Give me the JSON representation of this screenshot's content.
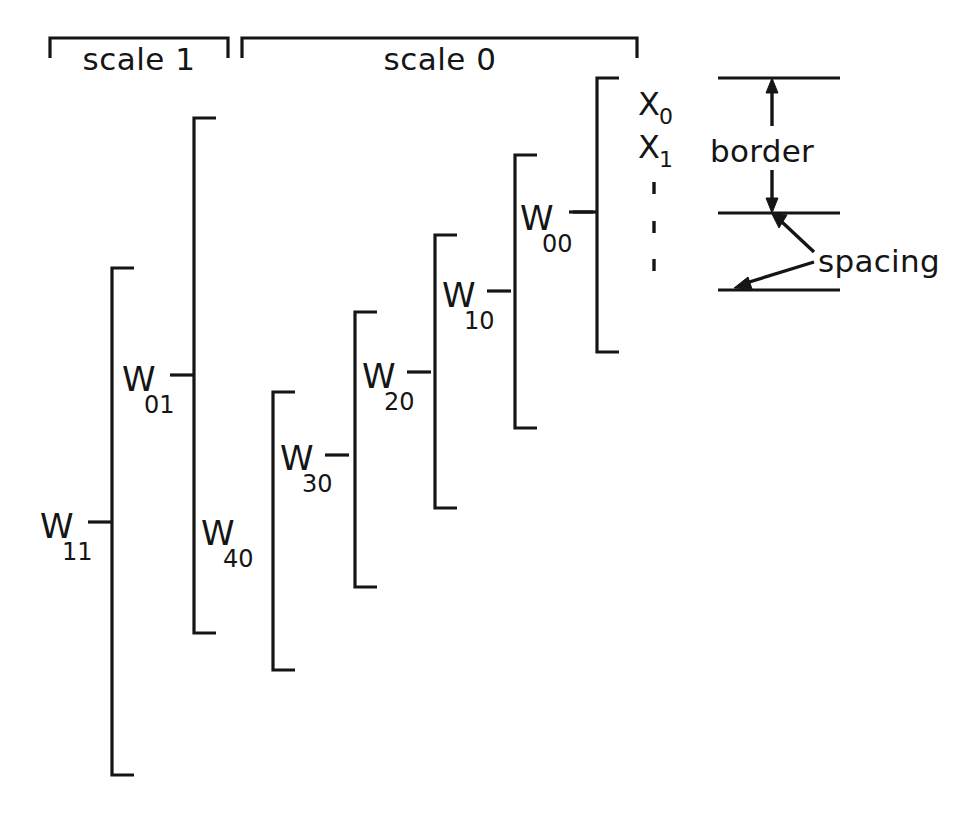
{
  "diagram": {
    "ink_color": "#151515",
    "background_color": "#ffffff",
    "scale_groups": [
      {
        "id": "scale-1",
        "label": "scale 1",
        "x_start": 50,
        "x_end": 228,
        "y": 38,
        "tick_depth": 20,
        "label_x": 139,
        "label_y": 68
      },
      {
        "id": "scale-0",
        "label": "scale 0",
        "x_start": 242,
        "x_end": 637,
        "y": 38,
        "tick_depth": 20,
        "label_x": 440,
        "label_y": 68
      }
    ],
    "brackets": [
      {
        "id": "w11",
        "base": "W",
        "sub": "11",
        "x": 112,
        "y_top": 268,
        "y_bottom": 775,
        "y_tick": 522,
        "arm": 22,
        "label_x": 44,
        "label_y": 545
      },
      {
        "id": "w01-w40",
        "base": "W",
        "sub": "01",
        "sub_second": "40",
        "x": 194,
        "y_top": 118,
        "y_bottom": 633,
        "y_tick": 375,
        "arm": 22,
        "label_x": 126,
        "label_y": 398,
        "label2_x": 205,
        "label2_y": 552
      },
      {
        "id": "w30",
        "base": "W",
        "sub": "30",
        "x": 273,
        "y_top": 392,
        "y_bottom": 670,
        "y_tick": 455,
        "arm": 22,
        "label_x": 284,
        "label_y": 477
      },
      {
        "id": "w20",
        "base": "W",
        "sub": "20",
        "x": 355,
        "y_top": 312,
        "y_bottom": 587,
        "y_tick": 372,
        "arm": 22,
        "label_x": 366,
        "label_y": 395
      },
      {
        "id": "w10",
        "base": "W",
        "sub": "10",
        "x": 435,
        "y_top": 235,
        "y_bottom": 508,
        "y_tick": 291,
        "arm": 22,
        "label_x": 446,
        "label_y": 315
      },
      {
        "id": "w00",
        "base": "W",
        "sub": "00",
        "x": 515,
        "y_top": 155,
        "y_bottom": 428,
        "y_tick": 212,
        "arm": 22,
        "label_x": 524,
        "label_y": 237
      },
      {
        "id": "x-vector",
        "base": "X",
        "sub": "",
        "x": 597,
        "y_top": 78,
        "y_bottom": 352,
        "y_tick": 212,
        "arm": 22,
        "label_x": 0,
        "label_y": 0
      }
    ],
    "x_entries": [
      {
        "base": "X",
        "sub": "0",
        "x": 640,
        "y": 115
      },
      {
        "base": "X",
        "sub": "1",
        "x": 640,
        "y": 158
      }
    ],
    "x_continuation_dots": [
      {
        "x": 654,
        "y_top": 182,
        "y_bottom": 194
      },
      {
        "x": 654,
        "y_top": 221,
        "y_bottom": 233
      },
      {
        "x": 654,
        "y_top": 259,
        "y_bottom": 271
      }
    ],
    "detail_panel": {
      "rules": [
        {
          "id": "rule-top",
          "x_start": 718,
          "x_end": 840,
          "y": 78
        },
        {
          "id": "rule-middle",
          "x_start": 718,
          "x_end": 840,
          "y": 213
        },
        {
          "id": "rule-bottom",
          "x_start": 718,
          "x_end": 840,
          "y": 290
        }
      ],
      "border_label": {
        "text": "border",
        "x": 712,
        "y": 152
      },
      "spacing_label": {
        "text": "spacing",
        "x": 820,
        "y": 265
      },
      "border_arrow_up": {
        "x": 772,
        "y_tail": 124,
        "y_head": 80
      },
      "border_arrow_down": {
        "x": 772,
        "y_tail": 172,
        "y_head": 211
      },
      "spacing_arrow_upper": {
        "x_tail": 812,
        "y_tail": 252,
        "x_head": 774,
        "y_head": 216
      },
      "spacing_arrow_lower": {
        "x_tail": 812,
        "y_tail": 262,
        "x_head": 734,
        "y_head": 288
      }
    }
  }
}
